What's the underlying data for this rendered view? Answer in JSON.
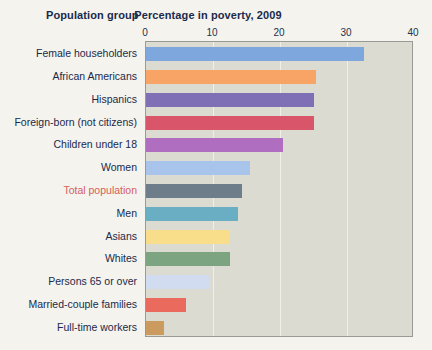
{
  "header": {
    "group_title": "Population group",
    "value_title": "Percentage in poverty, 2009"
  },
  "colors": {
    "page_background": "#f4f3ee",
    "plot_background": "#dcdbd2",
    "plot_border": "#9a9a94",
    "gridline": "#f0efe9",
    "text": "#1b2a4a",
    "highlight_label": "#d4605c"
  },
  "chart_data": {
    "type": "bar",
    "orientation": "horizontal",
    "title": "Percentage in poverty, 2009",
    "xlabel": "Percentage in poverty, 2009",
    "ylabel": "Population group",
    "xlim": [
      0,
      40
    ],
    "xticks": [
      "0",
      "10",
      "20",
      "30",
      "40"
    ],
    "xtick_values": [
      0,
      10,
      20,
      30,
      40
    ],
    "grid": true,
    "legend": "none",
    "categories": [
      "Female householders",
      "African Americans",
      "Hispanics",
      "Foreign-born (not citizens)",
      "Children under 18",
      "Women",
      "Total population",
      "Men",
      "Asians",
      "Whites",
      "Persons 65 or over",
      "Married-couple families",
      "Full-time workers"
    ],
    "values": [
      32.5,
      25.4,
      25.0,
      25.0,
      20.5,
      15.5,
      14.3,
      13.8,
      12.5,
      12.5,
      9.5,
      6.0,
      2.7
    ],
    "bar_colors": [
      "#7da7dd",
      "#f9a467",
      "#7f6fb5",
      "#d9566a",
      "#b06ec0",
      "#a9c4ea",
      "#6e7d8a",
      "#6aaec4",
      "#f8dd8a",
      "#7da481",
      "#d2dcf0",
      "#ea6a5e",
      "#cb9a5e"
    ],
    "highlighted_categories": [
      "Total population"
    ]
  }
}
